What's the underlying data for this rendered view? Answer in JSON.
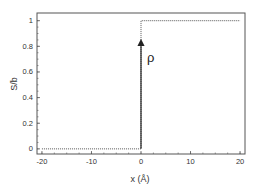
{
  "chart_data": {
    "type": "line",
    "title": "",
    "xlabel": "x (Å)",
    "ylabel": "S/b",
    "xlim": [
      -21,
      21
    ],
    "ylim": [
      -0.04,
      1.06
    ],
    "xticks": [
      -20,
      -10,
      0,
      10,
      20
    ],
    "xtick_labels": [
      "-20",
      "-10",
      "0",
      "10",
      "20"
    ],
    "yticks": [
      0,
      0.2,
      0.4,
      0.6,
      0.8,
      1
    ],
    "ytick_labels": [
      "0",
      "0.2",
      "0.4",
      "0.6",
      "0.8",
      "1"
    ],
    "grid": false,
    "series": [
      {
        "name": "step",
        "style": "dotted",
        "x": [
          -20,
          0,
          0,
          20
        ],
        "y": [
          0,
          0,
          1,
          1
        ]
      }
    ],
    "annotations": [
      {
        "text": "ρ",
        "type": "arrow",
        "x": 0,
        "y_from": 0,
        "y_to": 0.83
      }
    ]
  }
}
